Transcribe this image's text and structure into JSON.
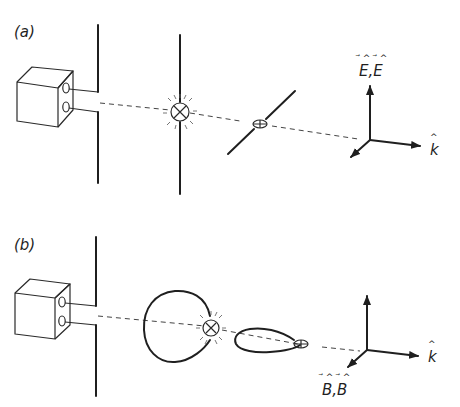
{
  "panels": [
    {
      "label": "(a)",
      "field_axis_label_vertical": "E,E",
      "field_axis_label_horizontal": "k",
      "description": "Transmitter box with two terminals feeding a dipole antenna; receiving dipole in plane with glowing bulb; tilted dipole with dim bulb"
    },
    {
      "label": "(b)",
      "field_axis_label_oblique": "B,B",
      "field_axis_label_horizontal": "k",
      "description": "Transmitter box with dipole antenna; receiving loop antenna with glowing bulb; loop in horizontal plane with dim bulb"
    }
  ],
  "colors": {
    "ink": "#1f1f1f",
    "background": "#ffffff"
  }
}
